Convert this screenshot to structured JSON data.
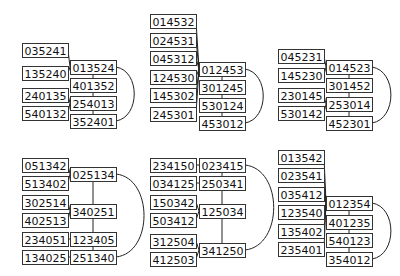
{
  "diagrams": [
    {
      "nodes": [
        {
          "id": "a0",
          "label": "035241",
          "x": 22,
          "y": 43
        },
        {
          "id": "a1",
          "label": "135240",
          "x": 22,
          "y": 66
        },
        {
          "id": "a2",
          "label": "240135",
          "x": 22,
          "y": 88
        },
        {
          "id": "a3",
          "label": "540132",
          "x": 22,
          "y": 106
        },
        {
          "id": "c0",
          "label": "013524",
          "x": 70,
          "y": 60
        },
        {
          "id": "c1",
          "label": "401352",
          "x": 70,
          "y": 78
        },
        {
          "id": "c2",
          "label": "254013",
          "x": 70,
          "y": 96
        },
        {
          "id": "c3",
          "label": "352401",
          "x": 70,
          "y": 114
        }
      ],
      "edges": [
        [
          "a0",
          "c0"
        ],
        [
          "a1",
          "c0"
        ],
        [
          "a2",
          "c2"
        ],
        [
          "a3",
          "c2"
        ],
        [
          "c0",
          "c1"
        ],
        [
          "c1",
          "c2"
        ],
        [
          "c2",
          "c3"
        ]
      ],
      "arc": [
        "c0",
        "c3"
      ]
    },
    {
      "nodes": [
        {
          "id": "a0",
          "label": "014532",
          "x": 150,
          "y": 14
        },
        {
          "id": "a1",
          "label": "024531",
          "x": 150,
          "y": 33
        },
        {
          "id": "a2",
          "label": "045312",
          "x": 150,
          "y": 51
        },
        {
          "id": "a3",
          "label": "124530",
          "x": 150,
          "y": 70
        },
        {
          "id": "a4",
          "label": "145302",
          "x": 150,
          "y": 88
        },
        {
          "id": "a5",
          "label": "245301",
          "x": 150,
          "y": 107
        },
        {
          "id": "c0",
          "label": "012453",
          "x": 199,
          "y": 62
        },
        {
          "id": "c1",
          "label": "301245",
          "x": 199,
          "y": 80
        },
        {
          "id": "c2",
          "label": "530124",
          "x": 199,
          "y": 98
        },
        {
          "id": "c3",
          "label": "453012",
          "x": 199,
          "y": 116
        }
      ],
      "edges": [
        [
          "a0",
          "c0"
        ],
        [
          "a1",
          "c0"
        ],
        [
          "a2",
          "c0"
        ],
        [
          "a3",
          "c0"
        ],
        [
          "a4",
          "c0"
        ],
        [
          "a5",
          "c0"
        ],
        [
          "c0",
          "c1"
        ],
        [
          "c1",
          "c2"
        ],
        [
          "c2",
          "c3"
        ]
      ],
      "arc": [
        "c0",
        "c3"
      ]
    },
    {
      "nodes": [
        {
          "id": "a0",
          "label": "045231",
          "x": 278,
          "y": 49
        },
        {
          "id": "a1",
          "label": "145230",
          "x": 278,
          "y": 68
        },
        {
          "id": "a2",
          "label": "230145",
          "x": 278,
          "y": 88
        },
        {
          "id": "a3",
          "label": "530142",
          "x": 278,
          "y": 106
        },
        {
          "id": "c0",
          "label": "014523",
          "x": 326,
          "y": 60
        },
        {
          "id": "c1",
          "label": "301452",
          "x": 326,
          "y": 78
        },
        {
          "id": "c2",
          "label": "253014",
          "x": 326,
          "y": 97
        },
        {
          "id": "c3",
          "label": "452301",
          "x": 326,
          "y": 116
        }
      ],
      "edges": [
        [
          "a0",
          "c0"
        ],
        [
          "a1",
          "c0"
        ],
        [
          "a2",
          "c2"
        ],
        [
          "a3",
          "c2"
        ],
        [
          "c0",
          "c1"
        ],
        [
          "c1",
          "c2"
        ],
        [
          "c2",
          "c3"
        ]
      ],
      "arc": [
        "c0",
        "c3"
      ]
    },
    {
      "nodes": [
        {
          "id": "a0",
          "label": "051342",
          "x": 22,
          "y": 158
        },
        {
          "id": "a1",
          "label": "513402",
          "x": 22,
          "y": 176
        },
        {
          "id": "a2",
          "label": "302514",
          "x": 22,
          "y": 195
        },
        {
          "id": "a3",
          "label": "402513",
          "x": 22,
          "y": 213
        },
        {
          "id": "a4",
          "label": "234051",
          "x": 22,
          "y": 232
        },
        {
          "id": "a5",
          "label": "134025",
          "x": 22,
          "y": 250
        },
        {
          "id": "c0",
          "label": "025134",
          "x": 70,
          "y": 167
        },
        {
          "id": "c1",
          "label": "340251",
          "x": 70,
          "y": 204
        },
        {
          "id": "c2",
          "label": "123405",
          "x": 70,
          "y": 232
        },
        {
          "id": "c3",
          "label": "251340",
          "x": 70,
          "y": 250
        }
      ],
      "edges": [
        [
          "a0",
          "c0"
        ],
        [
          "a1",
          "c0"
        ],
        [
          "a2",
          "c1"
        ],
        [
          "a3",
          "c1"
        ],
        [
          "a4",
          "c2"
        ],
        [
          "a5",
          "c3"
        ],
        [
          "c0",
          "c1"
        ],
        [
          "c1",
          "c2"
        ],
        [
          "c2",
          "c3"
        ]
      ],
      "arc": [
        "c0",
        "c3"
      ]
    },
    {
      "nodes": [
        {
          "id": "a0",
          "label": "234150",
          "x": 150,
          "y": 158
        },
        {
          "id": "a1",
          "label": "034125",
          "x": 150,
          "y": 176
        },
        {
          "id": "a2",
          "label": "150342",
          "x": 150,
          "y": 195
        },
        {
          "id": "a3",
          "label": "503412",
          "x": 150,
          "y": 213
        },
        {
          "id": "a4",
          "label": "312504",
          "x": 150,
          "y": 234
        },
        {
          "id": "a5",
          "label": "412503",
          "x": 150,
          "y": 252
        },
        {
          "id": "c0",
          "label": "023415",
          "x": 199,
          "y": 158
        },
        {
          "id": "c1",
          "label": "250341",
          "x": 199,
          "y": 176
        },
        {
          "id": "c2",
          "label": "125034",
          "x": 199,
          "y": 204
        },
        {
          "id": "c3",
          "label": "341250",
          "x": 199,
          "y": 243
        }
      ],
      "edges": [
        [
          "a0",
          "c0"
        ],
        [
          "a1",
          "c1"
        ],
        [
          "a2",
          "c2"
        ],
        [
          "a3",
          "c2"
        ],
        [
          "a4",
          "c3"
        ],
        [
          "a5",
          "c3"
        ],
        [
          "c0",
          "c1"
        ],
        [
          "c1",
          "c2"
        ],
        [
          "c2",
          "c3"
        ]
      ],
      "arc": [
        "c0",
        "c3"
      ]
    },
    {
      "nodes": [
        {
          "id": "a0",
          "label": "013542",
          "x": 278,
          "y": 150
        },
        {
          "id": "a1",
          "label": "023541",
          "x": 278,
          "y": 168
        },
        {
          "id": "a2",
          "label": "035412",
          "x": 278,
          "y": 187
        },
        {
          "id": "a3",
          "label": "123540",
          "x": 278,
          "y": 205
        },
        {
          "id": "a4",
          "label": "135402",
          "x": 278,
          "y": 224
        },
        {
          "id": "a5",
          "label": "235401",
          "x": 278,
          "y": 242
        },
        {
          "id": "c0",
          "label": "012354",
          "x": 326,
          "y": 196
        },
        {
          "id": "c1",
          "label": "401235",
          "x": 326,
          "y": 215
        },
        {
          "id": "c2",
          "label": "540123",
          "x": 326,
          "y": 233
        },
        {
          "id": "c3",
          "label": "354012",
          "x": 326,
          "y": 252
        }
      ],
      "edges": [
        [
          "a0",
          "c0"
        ],
        [
          "a1",
          "c0"
        ],
        [
          "a2",
          "c0"
        ],
        [
          "a3",
          "c0"
        ],
        [
          "a4",
          "c0"
        ],
        [
          "a5",
          "c0"
        ],
        [
          "c0",
          "c1"
        ],
        [
          "c1",
          "c2"
        ],
        [
          "c2",
          "c3"
        ]
      ],
      "arc": [
        "c0",
        "c3"
      ]
    }
  ],
  "box": {
    "w": 46,
    "h": 14
  }
}
